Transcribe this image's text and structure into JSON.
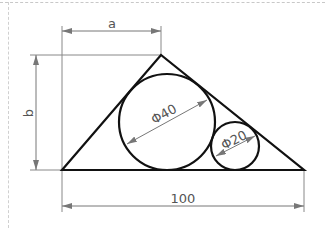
{
  "figure": {
    "type": "geometry-diagram",
    "dimensions": {
      "top": "a",
      "left": "b",
      "bottom": "100",
      "large_circle": "Φ40",
      "small_circle": "Φ20"
    },
    "colors": {
      "shape_stroke": "#111111",
      "dimension_stroke": "#777777",
      "text": "#555555",
      "frame": "#cccccc"
    }
  }
}
